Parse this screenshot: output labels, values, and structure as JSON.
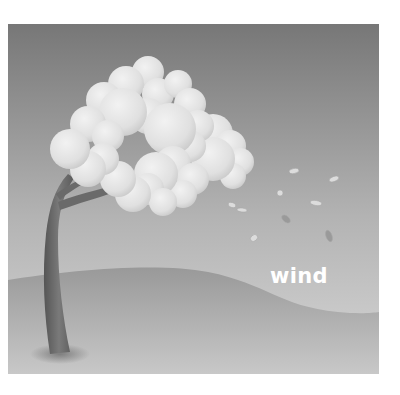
{
  "illustration": {
    "subject": "tree bending in the wind with leaves blowing away",
    "caption": "wind",
    "colors": {
      "sky_top": "#7a7a7a",
      "sky_bottom": "#cfcfcf",
      "ground_top": "#9c9c9c",
      "ground_bottom": "#c4c4c4",
      "canopy": "#e6e6e6",
      "trunk": "#6b6b6b",
      "caption": "#ffffff"
    }
  }
}
